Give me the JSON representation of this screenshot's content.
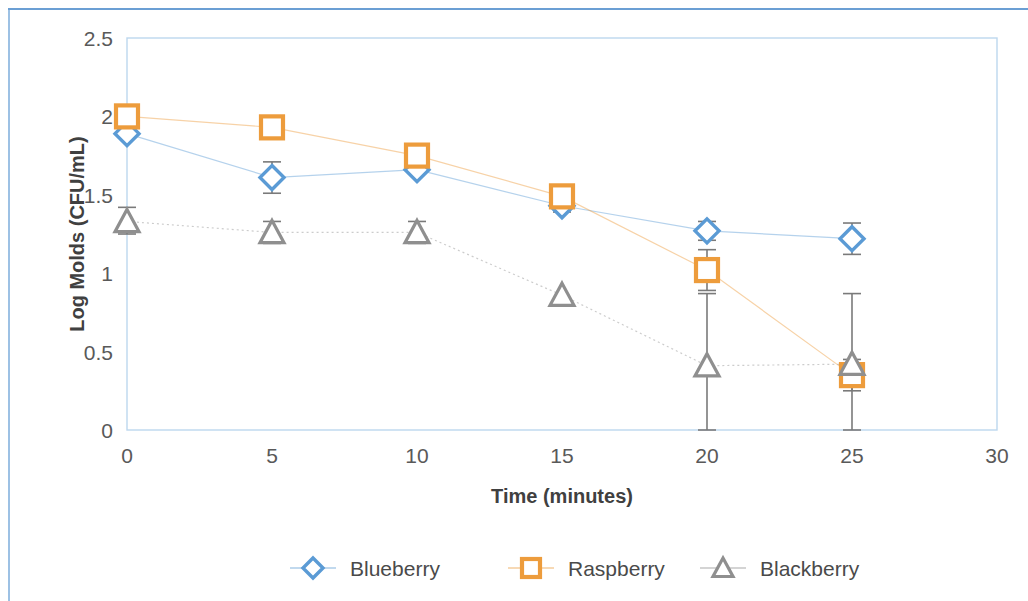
{
  "chart_data": {
    "type": "scatter",
    "title": "",
    "subtitle": "",
    "xlabel": "Time (minutes)",
    "ylabel": "Log Molds (CFU/mL)",
    "xlim": [
      0,
      30
    ],
    "ylim": [
      0,
      2.5
    ],
    "x_ticks": [
      0,
      5,
      10,
      15,
      20,
      25,
      30
    ],
    "x_tick_labels": [
      "0",
      "5",
      "10",
      "15",
      "20",
      "25",
      "30"
    ],
    "y_ticks": [
      0,
      0.5,
      1,
      1.5,
      2,
      2.5
    ],
    "y_tick_labels": [
      "0",
      "0.5",
      "1",
      "1.5",
      "2",
      "2.5"
    ],
    "grid": false,
    "legend_position": "bottom",
    "x": [
      0,
      5,
      10,
      15,
      20,
      25
    ],
    "series": [
      {
        "name": "Blueberry",
        "marker": "diamond",
        "color": "#5B9BD5",
        "line_style": "solid-light",
        "values": [
          1.89,
          1.61,
          1.66,
          1.43,
          1.27,
          1.22
        ],
        "errors": [
          0.0,
          0.1,
          0.0,
          0.04,
          0.06,
          0.1
        ]
      },
      {
        "name": "Raspberry",
        "marker": "square",
        "color": "#ED9C3C",
        "line_style": "solid-light",
        "values": [
          2.0,
          1.93,
          1.75,
          1.49,
          1.02,
          0.35
        ],
        "errors": [
          0.0,
          0.0,
          0.0,
          0.0,
          0.13,
          0.1
        ]
      },
      {
        "name": "Blackberry",
        "marker": "triangle",
        "color": "#8F8F8F",
        "line_style": "dotted",
        "values": [
          1.33,
          1.26,
          1.26,
          0.86,
          0.41,
          0.42
        ],
        "errors_asym": [
          {
            "up": 0.09,
            "down": 0.08
          },
          {
            "up": 0.07,
            "down": 0.07
          },
          {
            "up": 0.07,
            "down": 0.07
          },
          {
            "up": 0.0,
            "down": 0.0
          },
          {
            "up": 0.46,
            "down": 0.41
          },
          {
            "up": 0.45,
            "down": 0.42
          }
        ]
      }
    ],
    "legend": [
      {
        "label": "Blueberry",
        "color": "#5B9BD5",
        "marker": "diamond"
      },
      {
        "label": "Raspberry",
        "color": "#ED9C3C",
        "marker": "square"
      },
      {
        "label": "Blackberry",
        "color": "#8F8F8F",
        "marker": "triangle"
      }
    ]
  },
  "colors": {
    "blueberry": "#5B9BD5",
    "raspberry": "#ED9C3C",
    "blackberry": "#8F8F8F",
    "plot_border": "#BDD7EE",
    "frame": "#6B9FD4",
    "tick_label": "#595959",
    "axis_title": "#404040",
    "background": "#FFFFFF"
  }
}
